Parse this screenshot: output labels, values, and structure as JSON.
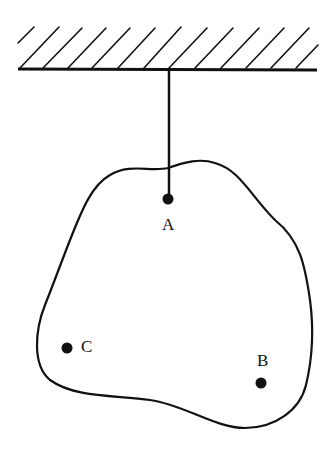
{
  "diagram": {
    "ceiling": {
      "x1": 18,
      "x2": 317,
      "y": 70,
      "hatch_count": 13
    },
    "string": {
      "x": 169,
      "y1": 70,
      "y2": 198
    },
    "points": [
      {
        "id": "A",
        "label": "A",
        "x": 168,
        "y": 199,
        "label_x": 162,
        "label_y": 230
      },
      {
        "id": "B",
        "label": "B",
        "x": 261,
        "y": 383,
        "label_x": 257,
        "label_y": 366
      },
      {
        "id": "C",
        "label": "C",
        "x": 67,
        "y": 348,
        "label_x": 81,
        "label_y": 352
      }
    ],
    "line_color": "#111111",
    "background": "#ffffff"
  }
}
